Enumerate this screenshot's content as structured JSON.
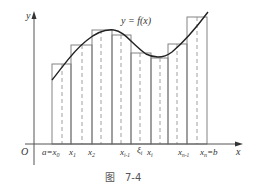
{
  "figure": {
    "curve_label": "y = f(x)",
    "y_axis_label": "y",
    "x_axis_label": "x",
    "origin_label": "O",
    "caption_char": "图",
    "caption_number": "7-4",
    "colors": {
      "ink": "#333333",
      "rect": "#777777",
      "dash": "#888888"
    }
  },
  "x_ticks": {
    "a_x0": "a=x",
    "a_x0_sub": "0",
    "x1": "x",
    "x1_sub": "1",
    "x2": "x",
    "x2_sub": "2",
    "xi_1": "x",
    "xi_1_sub": "i-1",
    "xi_sym": "ξ",
    "xi_sym_sub": "i",
    "xi": "x",
    "xi_sub": "i",
    "xn_1": "x",
    "xn_1_sub": "n-1",
    "xn_b": "x",
    "xn_b_sub": "n",
    "xn_b_tail": "=b"
  },
  "rectangles": [
    {
      "x0": 52,
      "x1": 71,
      "top": 64,
      "sample": 62
    },
    {
      "x0": 71,
      "x1": 92,
      "top": 45,
      "sample": 82
    },
    {
      "x0": 92,
      "x1": 112,
      "top": 30,
      "sample": 101
    },
    {
      "x0": 112,
      "x1": 131,
      "top": 35,
      "sample": 121
    },
    {
      "x0": 131,
      "x1": 151,
      "top": 53,
      "sample": 140
    },
    {
      "x0": 151,
      "x1": 168,
      "top": 58,
      "sample": 160
    },
    {
      "x0": 168,
      "x1": 187,
      "top": 44,
      "sample": 177
    },
    {
      "x0": 187,
      "x1": 207,
      "top": 17,
      "sample": 197
    }
  ]
}
